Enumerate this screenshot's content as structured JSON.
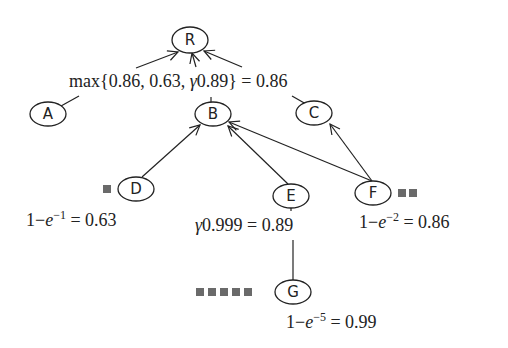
{
  "nodes": {
    "R": {
      "label": "R"
    },
    "A": {
      "label": "A"
    },
    "B": {
      "label": "B"
    },
    "C": {
      "label": "C"
    },
    "D": {
      "label": "D"
    },
    "E": {
      "label": "E"
    },
    "F": {
      "label": "F"
    },
    "G": {
      "label": "G"
    }
  },
  "edges": [
    {
      "from": "B",
      "to": "R"
    },
    {
      "from": "A",
      "to": "R"
    },
    {
      "from": "C",
      "to": "R"
    },
    {
      "from": "D",
      "to": "B"
    },
    {
      "from": "E",
      "to": "B"
    },
    {
      "from": "F",
      "to": "B"
    },
    {
      "from": "F",
      "to": "C"
    },
    {
      "from": "G",
      "to": "E"
    }
  ],
  "annotations": {
    "root": "max{0.86, 0.63, γ0.89} = 0.86",
    "D": "1−e⁻¹ = 0.63",
    "E": "γ0.999 = 0.89",
    "F": "1−e⁻² = 0.86",
    "G": "1−e⁻⁵ = 0.99"
  },
  "math_parts": {
    "root_max": "max{0.86, 0.63, ",
    "root_gamma": "γ",
    "root_tail": "0.89} = 0.86",
    "one_minus": "1−",
    "e": "e",
    "exp_D": "−1",
    "exp_F": "−2",
    "exp_G": "−5",
    "eq_D": " = 0.63",
    "eq_F": " = 0.86",
    "eq_G": " = 0.99",
    "gamma": "γ",
    "E_tail": "0.999 = 0.89"
  },
  "markers": {
    "D": 1,
    "F": 2,
    "G": 5
  }
}
